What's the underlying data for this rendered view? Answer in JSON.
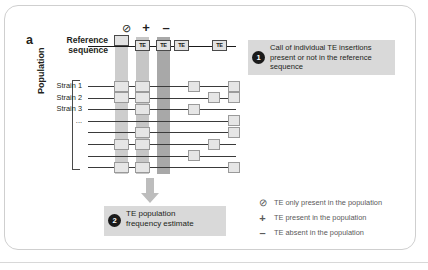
{
  "figure": {
    "panel_label": "a",
    "reference_label_line1": "Reference",
    "reference_label_line2": "sequence",
    "population_label": "Population"
  },
  "column_symbols": [
    {
      "id": "none",
      "glyph": "⊘",
      "name": "circle-slash-symbol"
    },
    {
      "id": "plus",
      "glyph": "+",
      "name": "plus-symbol"
    },
    {
      "id": "minus",
      "glyph": "–",
      "name": "minus-symbol"
    }
  ],
  "strains": [
    {
      "label": "Strain 1"
    },
    {
      "label": "Strain 2"
    },
    {
      "label": "Strain 3"
    },
    {
      "label": "..."
    }
  ],
  "reference_boxes": [
    {
      "label": ""
    },
    {
      "label": "TE"
    },
    {
      "label": "TE"
    },
    {
      "label": "TE"
    },
    {
      "label": "TE"
    }
  ],
  "callouts": [
    {
      "number": "1",
      "text": "Call of individual TE insertions present or not in the reference sequence"
    },
    {
      "number": "2",
      "text": "TE population frequency estimate"
    }
  ],
  "legend": [
    {
      "symbol": "⊘",
      "text": "TE only present in the population"
    },
    {
      "symbol": "+",
      "text": "TE present in the population"
    },
    {
      "symbol": "–",
      "text": "TE absent in the population"
    }
  ],
  "chart_data": {
    "type": "heatmap",
    "xlabel": "Genomic position (TE insertion sites)",
    "ylabel": "Strains in population",
    "column_states": [
      "only-in-population",
      "present",
      "absent"
    ],
    "reference_row": [
      0,
      1,
      1,
      1,
      1
    ],
    "rows": [
      {
        "name": "Strain 1",
        "columns": [
          1,
          1,
          0
        ],
        "extra_sites": [
          1,
          0,
          1
        ]
      },
      {
        "name": "Strain 2",
        "columns": [
          1,
          1,
          0
        ],
        "extra_sites": [
          0,
          1,
          1
        ]
      },
      {
        "name": "Strain 3",
        "columns": [
          0,
          1,
          0
        ],
        "extra_sites": [
          1,
          0,
          0
        ]
      },
      {
        "name": "...",
        "columns": [
          0,
          0,
          0
        ],
        "extra_sites": [
          0,
          0,
          1
        ]
      },
      {
        "name": "row5",
        "columns": [
          0,
          1,
          0
        ],
        "extra_sites": [
          0,
          0,
          1
        ]
      },
      {
        "name": "row6",
        "columns": [
          1,
          1,
          0
        ],
        "extra_sites": [
          0,
          1,
          0
        ]
      },
      {
        "name": "row7",
        "columns": [
          0,
          0,
          0
        ],
        "extra_sites": [
          1,
          0,
          0
        ]
      },
      {
        "name": "row8",
        "columns": [
          1,
          1,
          0
        ],
        "extra_sites": [
          0,
          0,
          1
        ]
      }
    ],
    "legend": [
      "TE only present in the population",
      "TE present in the population",
      "TE absent in the population"
    ]
  },
  "colors": {
    "band_light": "#cdcdcd",
    "band_mid": "#c6c6c6",
    "band_dark": "#a8a8a8",
    "callout_bg": "#d9d9d9",
    "marker": "#1a1a1a",
    "box_fill": "#e6e6e6",
    "legend_text": "#5a5a5a"
  }
}
